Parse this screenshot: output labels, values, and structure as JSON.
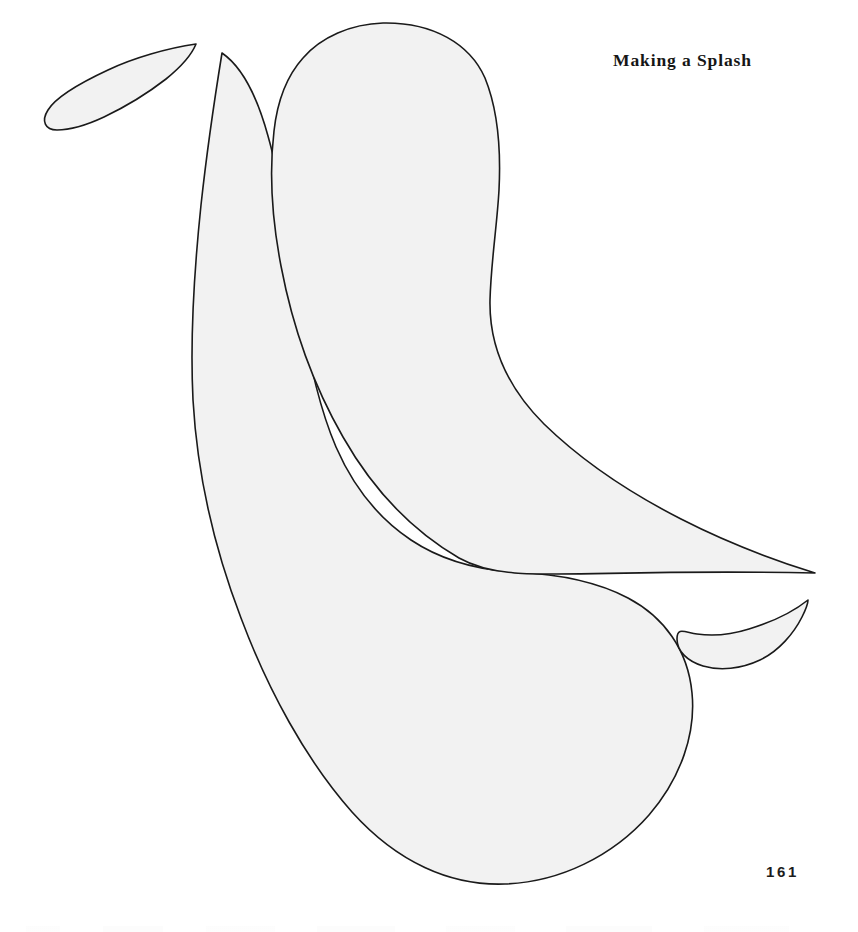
{
  "page": {
    "width": 858,
    "height": 932,
    "background_color": "#ffffff",
    "title": "Making a Splash",
    "folio": "161",
    "kind": "scanned-pattern-template-page"
  },
  "style": {
    "shape_fill": "#f2f2f2",
    "shape_stroke": "#1a1a1a",
    "stroke_width": 1.6,
    "title_color": "#161616",
    "folio_color": "#1c1c1c"
  },
  "shapes": [
    {
      "id": "small-droplet-upper-left",
      "label": "Small splash droplet (upper left)",
      "fill": "#f2f2f2",
      "stroke": "#1a1a1a",
      "path": "M 196 44 C 168 48 133 58 108 70 C 80 83 56 97 48 110 C 41 121 45 130 57 130 C 71 130 89 124 104 117 C 125 107 148 93 166 79 C 182 66 192 54 196 44 Z"
    },
    {
      "id": "large-crescent-left",
      "label": "Large splash crescent (left, tapering tail up, bulb down)",
      "fill": "#f2f2f2",
      "stroke": "#1a1a1a",
      "path": "M 222 53 C 216 90 207 150 201 205 C 194 272 190 340 193 400 C 197 470 213 545 241 618 C 268 690 306 760 352 812 C 397 862 450 886 505 884 C 560 882 613 856 649 815 C 681 778 696 733 692 693 C 688 650 664 617 628 598 C 596 581 557 574 516 572 C 477 570 441 560 411 540 C 378 518 353 486 336 447 C 318 405 308 357 300 305 C 291 246 281 182 268 136 C 257 96 241 66 222 53 Z"
    },
    {
      "id": "large-crescent-right",
      "label": "Large splash crescent (right, bulb up, tapering tail down-right)",
      "fill": "#f2f2f2",
      "stroke": "#1a1a1a",
      "path": "M 383 23 C 351 24 321 37 303 58 C 285 78 277 104 274 131 C 269 173 272 219 281 266 C 292 324 312 383 343 437 C 372 488 411 530 459 558 C 509 586 567 568 815 573 C 770 559 724 541 681 519 C 630 493 582 461 544 424 C 509 389 489 348 490 300 C 491 262 497 226 499 190 C 501 150 498 110 485 78 C 470 44 433 22 383 23 Z"
    },
    {
      "id": "small-droplet-lower-right",
      "label": "Small splash droplet (lower right)",
      "fill": "#f2f2f2",
      "stroke": "#1a1a1a",
      "path": "M 808 600 C 793 612 772 622 749 629 C 730 635 711 636 697 634 C 684 632 677 627 677 639 C 677 651 687 661 703 666 C 720 671 741 669 760 660 C 779 651 794 633 802 617 C 806 609 808 603 808 600 Z"
    }
  ]
}
